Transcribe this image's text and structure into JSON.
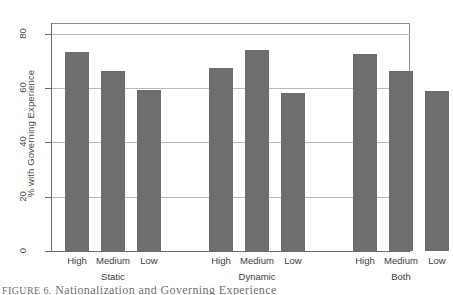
{
  "chart_data": {
    "type": "bar",
    "title": "",
    "xlabel": "",
    "ylabel": "% with Governing Experience",
    "ylim": [
      0,
      84
    ],
    "yticks": [
      0,
      20,
      40,
      60,
      80
    ],
    "grid": true,
    "legend": "none",
    "categories": [
      "High",
      "Medium",
      "Low"
    ],
    "groups": [
      "Static",
      "Dynamic",
      "Both"
    ],
    "series": [
      {
        "name": "Static",
        "categories": [
          "High",
          "Medium",
          "Low"
        ],
        "values": [
          73.2,
          66.5,
          59.4
        ]
      },
      {
        "name": "Dynamic",
        "categories": [
          "High",
          "Medium",
          "Low"
        ],
        "values": [
          67.3,
          74.1,
          58.4
        ]
      },
      {
        "name": "Both",
        "categories": [
          "High",
          "Medium",
          "Low"
        ],
        "values": [
          72.7,
          66.3,
          59.0
        ]
      }
    ],
    "bar_color": "#6e6e6e",
    "gridline_color": "#b9b9b9",
    "axis_color": "#6d6d6d"
  },
  "axis": {
    "y_title": "% with Governing Experience",
    "tick_labels": [
      "0",
      "20",
      "40",
      "60",
      "80"
    ]
  },
  "groups": [
    {
      "name": "Static",
      "label": "Static",
      "bars": [
        {
          "category": "High",
          "label": "High",
          "value": 73.2
        },
        {
          "category": "Medium",
          "label": "Medium",
          "value": 66.5
        },
        {
          "category": "Low",
          "label": "Low",
          "value": 59.4
        }
      ]
    },
    {
      "name": "Dynamic",
      "label": "Dynamic",
      "bars": [
        {
          "category": "High",
          "label": "High",
          "value": 67.3
        },
        {
          "category": "Medium",
          "label": "Medium",
          "value": 74.1
        },
        {
          "category": "Low",
          "label": "Low",
          "value": 58.4
        }
      ]
    },
    {
      "name": "Both",
      "label": "Both",
      "bars": [
        {
          "category": "High",
          "label": "High",
          "value": 72.7
        },
        {
          "category": "Medium",
          "label": "Medium",
          "value": 66.3
        },
        {
          "category": "Low",
          "label": "Low",
          "value": 59.0
        }
      ]
    }
  ],
  "caption": {
    "prefix": "FIGURE 6.",
    "text": "Nationalization and Governing Experience"
  },
  "colors": {
    "bar": "#6e6e6e",
    "grid": "#b9b9b9",
    "axis": "#6d6d6d",
    "text": "#3c3c3c",
    "background": "#ffffff"
  }
}
